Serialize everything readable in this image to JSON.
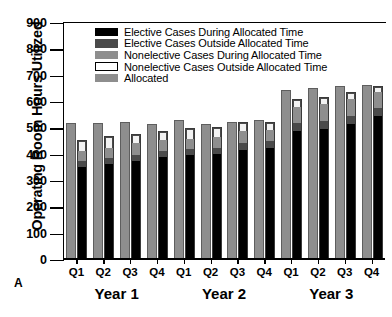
{
  "panel_label": "A",
  "chart_data": {
    "type": "bar",
    "title": "",
    "xlabel": "",
    "ylabel": "Operating Room Hours Utilized",
    "ylim": [
      0,
      900
    ],
    "ytick_step": 100,
    "yticks": [
      0,
      100,
      200,
      300,
      400,
      500,
      600,
      700,
      800,
      900
    ],
    "grid": false,
    "legend_position": "top-left-inside",
    "categories": [
      "Q1",
      "Q2",
      "Q3",
      "Q4",
      "Q1",
      "Q2",
      "Q3",
      "Q4",
      "Q1",
      "Q2",
      "Q3",
      "Q4"
    ],
    "group_labels": [
      "Year 1",
      "Year 2",
      "Year 3"
    ],
    "legend": [
      "Elective Cases During Allocated Time",
      "Elective Cases Outside Allocated Time",
      "Nonelective Cases During Allocated Time",
      "Nonelective Cases Outside Allocated Time",
      "Allocated"
    ],
    "colors": {
      "elective_during": "#000000",
      "elective_outside": "#4a4a4a",
      "nonelective_during": "#8e8e8e",
      "nonelective_outside": "#f2f2f2",
      "allocated": "#8e8e8e"
    },
    "series": [
      {
        "name": "Allocated",
        "values": [
          520,
          520,
          525,
          518,
          530,
          515,
          525,
          530,
          645,
          655,
          660,
          665
        ]
      },
      {
        "name": "Elective Cases During Allocated Time",
        "values": [
          355,
          368,
          378,
          392,
          400,
          405,
          420,
          428,
          492,
          500,
          520,
          548
        ]
      },
      {
        "name": "Elective Cases Outside Allocated Time",
        "values": [
          22,
          20,
          24,
          26,
          24,
          22,
          26,
          28,
          30,
          32,
          30,
          32
        ]
      },
      {
        "name": "Nonelective Cases During Allocated Time",
        "values": [
          42,
          40,
          44,
          42,
          40,
          44,
          46,
          42,
          62,
          64,
          66,
          60
        ]
      },
      {
        "name": "Nonelective Cases Outside Allocated Time",
        "values": [
          36,
          42,
          34,
          30,
          38,
          34,
          32,
          28,
          26,
          24,
          22,
          20
        ]
      }
    ],
    "stack_totals": [
      455,
      470,
      480,
      490,
      502,
      505,
      524,
      526,
      610,
      620,
      638,
      660
    ]
  }
}
